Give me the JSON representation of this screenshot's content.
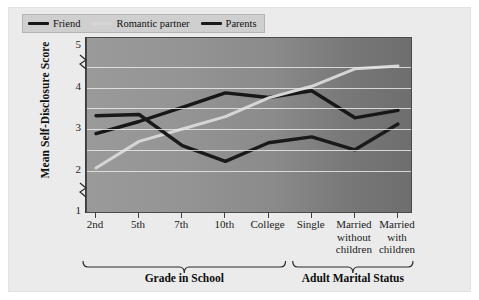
{
  "chart_data": {
    "type": "line",
    "title": "",
    "xlabel": "",
    "ylabel": "Mean Self-Disclosure Score",
    "ylim": [
      1,
      5
    ],
    "yticks": [
      1,
      2,
      3,
      4,
      5
    ],
    "ytick_labels": [
      "1",
      "2",
      "3",
      "4",
      "5"
    ],
    "y_axis_breaks": [
      1.5,
      4.6
    ],
    "grid": true,
    "gridlines_y": [
      2.0,
      2.5,
      3.0,
      3.5,
      4.0,
      4.5
    ],
    "legend_position": "top-left",
    "categories": [
      "2nd",
      "5th",
      "7th",
      "10th",
      "College",
      "Single",
      "Married without children",
      "Married with children"
    ],
    "tick_labels": [
      {
        "line1": "2nd",
        "line2": "",
        "line3": ""
      },
      {
        "line1": "5th",
        "line2": "",
        "line3": ""
      },
      {
        "line1": "7th",
        "line2": "",
        "line3": ""
      },
      {
        "line1": "10th",
        "line2": "",
        "line3": ""
      },
      {
        "line1": "College",
        "line2": "",
        "line3": ""
      },
      {
        "line1": "Single",
        "line2": "",
        "line3": ""
      },
      {
        "line1": "Married",
        "line2": "without",
        "line3": "children"
      },
      {
        "line1": "Married",
        "line2": "with",
        "line3": "children"
      }
    ],
    "series": [
      {
        "name": "Friend",
        "color": "#171717",
        "values": [
          2.89,
          3.18,
          3.52,
          3.87,
          3.76,
          3.92,
          3.27,
          3.45
        ]
      },
      {
        "name": "Romantic partner",
        "color": "#d6d6d6",
        "values": [
          2.06,
          2.7,
          3.0,
          3.3,
          3.75,
          4.03,
          4.45,
          4.52
        ]
      },
      {
        "name": "Parents",
        "color": "#1a1a1a",
        "values": [
          3.32,
          3.35,
          2.6,
          2.22,
          2.67,
          2.81,
          2.5,
          3.12
        ]
      }
    ],
    "groups": [
      {
        "label": "Grade in School",
        "from_category": "2nd",
        "to_category": "College"
      },
      {
        "label": "Adult Marital Status",
        "from_category": "Single",
        "to_category": "Married with children"
      }
    ],
    "legend": [
      {
        "label": "Friend",
        "color": "#171717"
      },
      {
        "label": "Romantic partner",
        "color": "#d6d6d6"
      },
      {
        "label": "Parents",
        "color": "#1a1a1a"
      }
    ]
  }
}
